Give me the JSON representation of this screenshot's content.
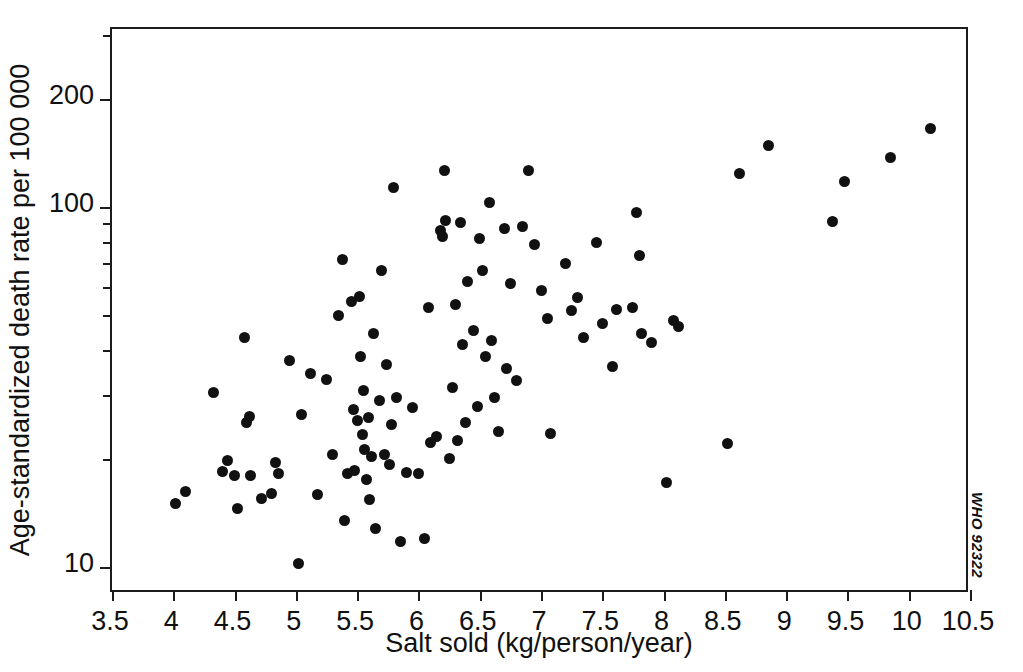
{
  "chart_data": {
    "type": "scatter",
    "title": "",
    "xlabel": "Salt sold (kg/person/year)",
    "ylabel": "Age-standardized death rate per 100 000",
    "xlim": [
      3.5,
      10.5
    ],
    "ylim": [
      10,
      260
    ],
    "yscale": "log",
    "xscale": "linear",
    "grid": false,
    "legend": null,
    "annotation": "WHO 92322",
    "xticks": [
      3.5,
      4,
      4.5,
      5,
      5.5,
      6,
      6.5,
      7,
      7.5,
      8,
      8.5,
      9,
      9.5,
      10,
      10.5
    ],
    "xticklabels": [
      "3.5",
      "4",
      "4.5",
      "5",
      "5.5",
      "6",
      "6.5",
      "7",
      "7.5",
      "8",
      "8.5",
      "9",
      "9.5",
      "10",
      "10.5"
    ],
    "yticks_major": [
      10,
      100,
      200
    ],
    "yticklabels": [
      "10",
      "100",
      "200"
    ],
    "yticks_minor": [
      20,
      30,
      40,
      50,
      60,
      70,
      80,
      90,
      300
    ],
    "marker": {
      "shape": "circle",
      "color": "#111111",
      "size_px": 11
    },
    "n_points": 117,
    "points": [
      [
        4.02,
        15.0
      ],
      [
        4.1,
        16.2
      ],
      [
        4.33,
        30.5
      ],
      [
        4.4,
        18.4
      ],
      [
        4.44,
        19.8
      ],
      [
        4.5,
        17.9
      ],
      [
        4.52,
        14.5
      ],
      [
        4.58,
        43.5
      ],
      [
        4.6,
        25.2
      ],
      [
        4.62,
        26.2
      ],
      [
        4.63,
        18.0
      ],
      [
        4.72,
        15.5
      ],
      [
        4.8,
        16.0
      ],
      [
        4.83,
        19.5
      ],
      [
        4.86,
        18.2
      ],
      [
        4.95,
        37.5
      ],
      [
        5.02,
        10.2
      ],
      [
        5.05,
        26.5
      ],
      [
        5.12,
        34.5
      ],
      [
        5.18,
        15.9
      ],
      [
        5.25,
        33.2
      ],
      [
        5.3,
        20.6
      ],
      [
        5.35,
        49.8
      ],
      [
        5.38,
        71.5
      ],
      [
        5.4,
        13.5
      ],
      [
        5.42,
        18.2
      ],
      [
        5.45,
        54.5
      ],
      [
        5.47,
        27.3
      ],
      [
        5.48,
        18.5
      ],
      [
        5.5,
        25.5
      ],
      [
        5.52,
        56.5
      ],
      [
        5.53,
        38.5
      ],
      [
        5.54,
        23.3
      ],
      [
        5.55,
        31.0
      ],
      [
        5.56,
        21.2
      ],
      [
        5.58,
        17.5
      ],
      [
        5.59,
        26.0
      ],
      [
        5.6,
        15.4
      ],
      [
        5.62,
        20.3
      ],
      [
        5.63,
        44.5
      ],
      [
        5.65,
        12.8
      ],
      [
        5.68,
        29.0
      ],
      [
        5.7,
        66.8
      ],
      [
        5.72,
        20.5
      ],
      [
        5.74,
        36.5
      ],
      [
        5.76,
        19.3
      ],
      [
        5.78,
        24.8
      ],
      [
        5.8,
        113.0
      ],
      [
        5.82,
        29.5
      ],
      [
        5.85,
        11.8
      ],
      [
        5.9,
        18.3
      ],
      [
        5.95,
        27.8
      ],
      [
        6.0,
        18.2
      ],
      [
        6.05,
        12.0
      ],
      [
        6.08,
        52.5
      ],
      [
        6.1,
        22.2
      ],
      [
        6.15,
        23.0
      ],
      [
        6.18,
        86.0
      ],
      [
        6.2,
        83.0
      ],
      [
        6.21,
        126.0
      ],
      [
        6.22,
        92.0
      ],
      [
        6.25,
        20.0
      ],
      [
        6.28,
        31.5
      ],
      [
        6.3,
        53.5
      ],
      [
        6.32,
        22.5
      ],
      [
        6.34,
        90.5
      ],
      [
        6.36,
        41.5
      ],
      [
        6.38,
        25.2
      ],
      [
        6.4,
        62.0
      ],
      [
        6.45,
        45.5
      ],
      [
        6.48,
        28.0
      ],
      [
        6.5,
        82.0
      ],
      [
        6.52,
        66.5
      ],
      [
        6.55,
        38.5
      ],
      [
        6.58,
        103.0
      ],
      [
        6.6,
        42.5
      ],
      [
        6.62,
        29.5
      ],
      [
        6.65,
        23.8
      ],
      [
        6.7,
        87.0
      ],
      [
        6.72,
        35.5
      ],
      [
        6.75,
        61.5
      ],
      [
        6.8,
        33.0
      ],
      [
        6.85,
        88.5
      ],
      [
        6.9,
        126.0
      ],
      [
        6.95,
        78.5
      ],
      [
        7.0,
        58.5
      ],
      [
        7.05,
        49.0
      ],
      [
        7.08,
        23.5
      ],
      [
        7.2,
        69.5
      ],
      [
        7.25,
        51.5
      ],
      [
        7.3,
        56.0
      ],
      [
        7.35,
        43.5
      ],
      [
        7.45,
        79.5
      ],
      [
        7.5,
        47.5
      ],
      [
        7.58,
        36.0
      ],
      [
        7.62,
        52.0
      ],
      [
        7.75,
        52.5
      ],
      [
        7.78,
        96.5
      ],
      [
        7.8,
        73.5
      ],
      [
        7.82,
        44.5
      ],
      [
        7.9,
        42.0
      ],
      [
        8.02,
        17.2
      ],
      [
        8.08,
        48.5
      ],
      [
        8.12,
        46.5
      ],
      [
        8.52,
        22.0
      ],
      [
        8.62,
        124.0
      ],
      [
        8.86,
        148.0
      ],
      [
        9.38,
        91.0
      ],
      [
        9.48,
        118.0
      ],
      [
        9.85,
        137.0
      ],
      [
        10.18,
        165.0
      ]
    ]
  }
}
